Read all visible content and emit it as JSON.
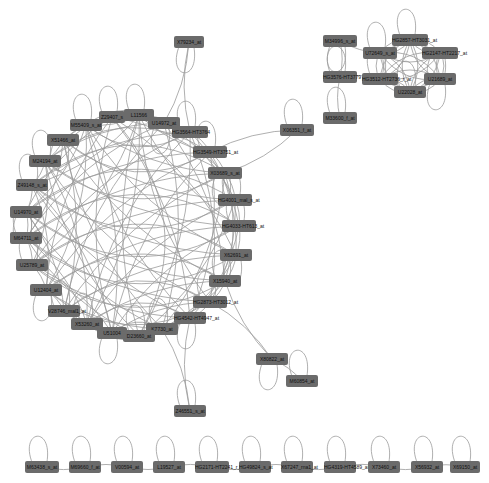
{
  "diagram": {
    "type": "network",
    "node_color": "#6b6b6b",
    "edge_color": "#9a9a9a",
    "label_color": "#111111",
    "background": "#ffffff"
  },
  "nodes": [
    {
      "id": "X79234_at",
      "x": 189,
      "y": 42,
      "w": 30
    },
    {
      "id": "Z29407_s",
      "x": 112,
      "y": 117,
      "w": 26
    },
    {
      "id": "L11566",
      "x": 139,
      "y": 115,
      "w": 30
    },
    {
      "id": "U14972_at",
      "x": 164,
      "y": 123,
      "w": 32
    },
    {
      "id": "M55409_s_at",
      "x": 86,
      "y": 125,
      "w": 32
    },
    {
      "id": "HG3564-HT3764",
      "x": 190,
      "y": 132,
      "w": 36
    },
    {
      "id": "X51466_at",
      "x": 63,
      "y": 140,
      "w": 32
    },
    {
      "id": "HG3549-HT3751_at",
      "x": 210,
      "y": 152,
      "w": 34
    },
    {
      "id": "M24194_at",
      "x": 45,
      "y": 161,
      "w": 32
    },
    {
      "id": "X03689_s_at",
      "x": 225,
      "y": 173,
      "w": 34
    },
    {
      "id": "Z49148_s_at",
      "x": 32,
      "y": 185,
      "w": 32
    },
    {
      "id": "HG4001_mal_s_at",
      "x": 235,
      "y": 200,
      "w": 34
    },
    {
      "id": "U14970_at",
      "x": 26,
      "y": 212,
      "w": 32
    },
    {
      "id": "HG4033-HT613_at",
      "x": 239,
      "y": 226,
      "w": 34
    },
    {
      "id": "M64711_at",
      "x": 26,
      "y": 238,
      "w": 32
    },
    {
      "id": "X62691_at",
      "x": 236,
      "y": 255,
      "w": 32
    },
    {
      "id": "U25789_at",
      "x": 32,
      "y": 265,
      "w": 32
    },
    {
      "id": "X15940_at",
      "x": 225,
      "y": 281,
      "w": 32
    },
    {
      "id": "U12404_at",
      "x": 46,
      "y": 290,
      "w": 32
    },
    {
      "id": "HG2873-HT3012_at",
      "x": 210,
      "y": 302,
      "w": 34
    },
    {
      "id": "V28746_mal1_at",
      "x": 64,
      "y": 311,
      "w": 32
    },
    {
      "id": "HG4542-HT4947_at",
      "x": 190,
      "y": 318,
      "w": 32
    },
    {
      "id": "X53260_at",
      "x": 87,
      "y": 324,
      "w": 32
    },
    {
      "id": "K7730_at",
      "x": 162,
      "y": 329,
      "w": 32
    },
    {
      "id": "U51004",
      "x": 112,
      "y": 333,
      "w": 30
    },
    {
      "id": "D23660_at",
      "x": 139,
      "y": 336,
      "w": 32
    },
    {
      "id": "X06351_f_at",
      "x": 297,
      "y": 130,
      "w": 34
    },
    {
      "id": "M34996_s_at",
      "x": 340,
      "y": 41,
      "w": 34
    },
    {
      "id": "HG2857-HT3031_at",
      "x": 410,
      "y": 40,
      "w": 36
    },
    {
      "id": "U72649_s_at",
      "x": 380,
      "y": 53,
      "w": 34
    },
    {
      "id": "HG2147-HT2217_at",
      "x": 440,
      "y": 53,
      "w": 36
    },
    {
      "id": "HG3576-HT3779",
      "x": 340,
      "y": 77,
      "w": 34
    },
    {
      "id": "HG3512-HT2736_r_at",
      "x": 380,
      "y": 79,
      "w": 36
    },
    {
      "id": "U21689_at",
      "x": 440,
      "y": 79,
      "w": 32
    },
    {
      "id": "U22028_at",
      "x": 410,
      "y": 92,
      "w": 32
    },
    {
      "id": "M33600_f_at",
      "x": 340,
      "y": 118,
      "w": 34
    },
    {
      "id": "X80822_at",
      "x": 272,
      "y": 359,
      "w": 32
    },
    {
      "id": "M60854_at",
      "x": 302,
      "y": 381,
      "w": 32
    },
    {
      "id": "Z46551_s_at",
      "x": 190,
      "y": 411,
      "w": 32
    },
    {
      "id": "M63438_s_at",
      "x": 42,
      "y": 467,
      "w": 34
    },
    {
      "id": "M69660_f_at",
      "x": 85,
      "y": 467,
      "w": 32
    },
    {
      "id": "V00594_at",
      "x": 127,
      "y": 467,
      "w": 32
    },
    {
      "id": "L19527_at",
      "x": 169,
      "y": 467,
      "w": 32
    },
    {
      "id": "HG2171-HT2241_r_at",
      "x": 212,
      "y": 467,
      "w": 34
    },
    {
      "id": "HG49824_s_at",
      "x": 255,
      "y": 467,
      "w": 32
    },
    {
      "id": "X67247_rna1_at",
      "x": 297,
      "y": 467,
      "w": 32
    },
    {
      "id": "HG4319-HT4589_at",
      "x": 340,
      "y": 467,
      "w": 32
    },
    {
      "id": "X73460_at",
      "x": 384,
      "y": 467,
      "w": 32
    },
    {
      "id": "X56932_at",
      "x": 427,
      "y": 467,
      "w": 32
    },
    {
      "id": "X69150_at",
      "x": 465,
      "y": 467,
      "w": 30
    }
  ],
  "ring_cluster": [
    "Z29407_s",
    "L11566",
    "U14972_at",
    "M55409_s_at",
    "HG3564-HT3764",
    "X51466_at",
    "HG3549-HT3751_at",
    "M24194_at",
    "X03689_s_at",
    "Z49148_s_at",
    "HG4001_mal_s_at",
    "U14970_at",
    "HG4033-HT613_at",
    "M64711_at",
    "X62691_at",
    "U25789_at",
    "X15940_at",
    "U12404_at",
    "HG2873-HT3012_at",
    "V28746_mal1_at",
    "HG4542-HT4947_at",
    "X53260_at",
    "K7730_at",
    "U51004",
    "D23660_at"
  ],
  "dense_cluster": [
    "HG2857-HT3031_at",
    "U72649_s_at",
    "HG2147-HT2217_at",
    "HG3512-HT2736_r_at",
    "U21689_at",
    "U22028_at"
  ],
  "edges": [
    [
      "X79234_at",
      "U14972_at"
    ],
    [
      "X79234_at",
      "HG3564-HT3764"
    ],
    [
      "X06351_f_at",
      "X03689_s_at"
    ],
    [
      "X06351_f_at",
      "HG3549-HT3751_at"
    ],
    [
      "M34996_s_at",
      "HG3576-HT3779"
    ],
    [
      "HG3576-HT3779",
      "M33600_f_at"
    ],
    [
      "HG3576-HT3779",
      "HG3512-HT2736_r_at"
    ],
    [
      "M34996_s_at",
      "U72649_s_at"
    ],
    [
      "K7730_at",
      "Z46551_s_at"
    ],
    [
      "HG4542-HT4947_at",
      "Z46551_s_at"
    ],
    [
      "HG2873-HT3012_at",
      "X80822_at"
    ],
    [
      "X15940_at",
      "X80822_at"
    ],
    [
      "X80822_at",
      "M60854_at"
    ],
    [
      "M63438_s_at",
      "M69660_f_at"
    ],
    [
      "M69660_f_at",
      "V00594_at"
    ],
    [
      "V00594_at",
      "L19527_at"
    ],
    [
      "L19527_at",
      "HG2171-HT2241_r_at"
    ],
    [
      "HG2171-HT2241_r_at",
      "HG49824_s_at"
    ],
    [
      "HG49824_s_at",
      "X67247_rna1_at"
    ],
    [
      "X67247_rna1_at",
      "HG4319-HT4589_at"
    ],
    [
      "HG4319-HT4589_at",
      "X73460_at"
    ],
    [
      "X73460_at",
      "X56932_at"
    ],
    [
      "X56932_at",
      "X69150_at"
    ]
  ]
}
